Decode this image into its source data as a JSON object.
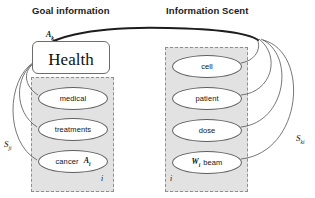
{
  "headers": {
    "goal": "Goal information",
    "scent": "Information Scent"
  },
  "goal_panel": {
    "concept": {
      "label": "Health",
      "variable": "A",
      "variable_subscript": "k"
    },
    "index_marker": "i",
    "nodes": [
      {
        "label": "medical",
        "variable": "",
        "variable_subscript": ""
      },
      {
        "label": "treatments",
        "variable": "",
        "variable_subscript": ""
      },
      {
        "label": "cancer",
        "variable": "A",
        "variable_subscript": "i"
      }
    ]
  },
  "scent_panel": {
    "index_marker": "i",
    "nodes": [
      {
        "label": "cell",
        "variable": "",
        "variable_subscript": ""
      },
      {
        "label": "patient",
        "variable": "",
        "variable_subscript": ""
      },
      {
        "label": "dose",
        "variable": "",
        "variable_subscript": ""
      },
      {
        "label": "beam",
        "variable": "W",
        "variable_subscript": "i"
      }
    ]
  },
  "strengths": {
    "left": {
      "symbol": "S",
      "subscript": "ji"
    },
    "right": {
      "symbol": "S",
      "subscript": "ki"
    }
  },
  "colors": {
    "panel_fill": "#e2e2e2",
    "panel_border": "#8e8e8e",
    "node_fill": "#ffffff",
    "node_border": "#5f5f5f",
    "wire_thin": "#4a4a4a",
    "wire_thick": "#1d1d1d",
    "text": "#111111"
  }
}
